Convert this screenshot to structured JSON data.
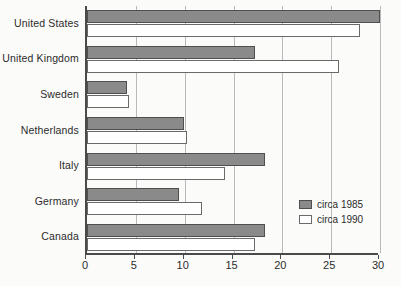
{
  "chart_data": {
    "type": "bar",
    "orientation": "horizontal",
    "title": "",
    "subtitle": "",
    "xlabel": "",
    "ylabel": "",
    "xlim": [
      0,
      30
    ],
    "xticks": [
      0,
      5,
      10,
      15,
      20,
      25,
      30
    ],
    "xtick_labels": [
      "0",
      "5",
      "10",
      "15",
      "20",
      "25",
      "30"
    ],
    "grid": true,
    "grid_axis": "x",
    "legend_position": "inside-bottom-right",
    "categories": [
      "United States",
      "United Kingdom",
      "Sweden",
      "Netherlands",
      "Italy",
      "Germany",
      "Canada"
    ],
    "series": [
      {
        "name": "circa 1985",
        "color": "#8a8a8a",
        "values": [
          30.0,
          17.2,
          4.1,
          9.9,
          18.2,
          9.4,
          18.2
        ]
      },
      {
        "name": "circa 1990",
        "color": "#ffffff",
        "values": [
          28.0,
          25.8,
          4.3,
          10.2,
          14.1,
          11.8,
          17.2
        ]
      }
    ],
    "legend": [
      "circa 1985",
      "circa 1990"
    ]
  },
  "colors": {
    "series_1985": "#8a8a8a",
    "series_1990": "#ffffff",
    "axis": "#4a4a4a",
    "grid": "#b9b9b9",
    "background": "#fbfbfa",
    "text": "#2b2b2b"
  }
}
